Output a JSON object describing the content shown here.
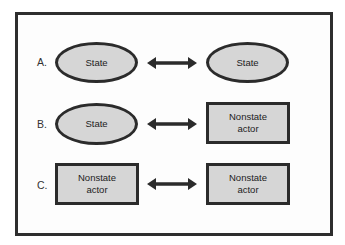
{
  "diagram": {
    "colors": {
      "node_fill": "#d6d6d6",
      "node_border": "#2b2b2b",
      "frame_border": "#2e2e2e",
      "arrow": "#2b2b2b"
    },
    "rows": [
      {
        "label": "A.",
        "left": {
          "shape": "ellipse",
          "text": "State"
        },
        "connector": "bidirectional-arrow",
        "right": {
          "shape": "ellipse",
          "text": "State"
        }
      },
      {
        "label": "B.",
        "left": {
          "shape": "ellipse",
          "text": "State"
        },
        "connector": "bidirectional-arrow",
        "right": {
          "shape": "rectangle",
          "text": "Nonstate actor"
        }
      },
      {
        "label": "C.",
        "left": {
          "shape": "rectangle",
          "text": "Nonstate actor"
        },
        "connector": "bidirectional-arrow",
        "right": {
          "shape": "rectangle",
          "text": "Nonstate actor"
        }
      }
    ]
  }
}
